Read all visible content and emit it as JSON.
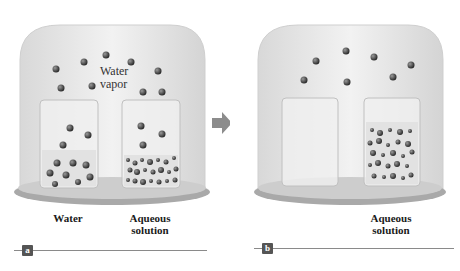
{
  "figure": {
    "arrow": "right-arrow",
    "panels": [
      {
        "id": "a",
        "badge": "a",
        "vapor_label_line1": "Water",
        "vapor_label_line2": "vapor",
        "beaker_labels": [
          "Water",
          "Aqueous",
          "solution"
        ]
      },
      {
        "id": "b",
        "badge": "b",
        "beaker_labels": [
          "Aqueous",
          "solution"
        ]
      }
    ],
    "colors": {
      "bell_jar": "#e6e6e6",
      "plate": "#b8b8b8",
      "molecule": "#3a3a3a",
      "arrow": "#8c8c8c",
      "badge": "#555555"
    }
  }
}
